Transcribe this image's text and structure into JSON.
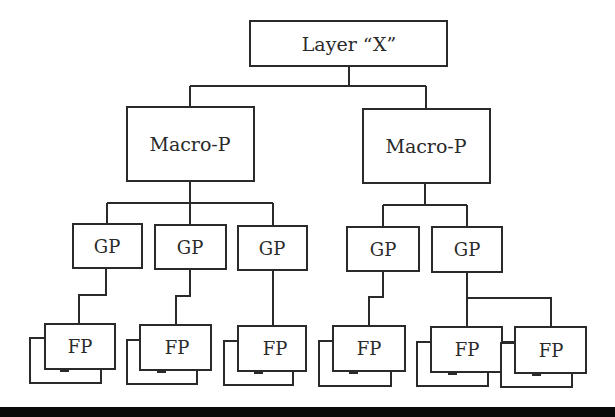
{
  "diagram": {
    "root": {
      "label": "Layer “X”"
    },
    "macros": [
      {
        "label": "Macro-P"
      },
      {
        "label": "Macro-P"
      }
    ],
    "gps": [
      {
        "label": "GP",
        "parent": 0
      },
      {
        "label": "GP",
        "parent": 0
      },
      {
        "label": "GP",
        "parent": 0
      },
      {
        "label": "GP",
        "parent": 1
      },
      {
        "label": "GP",
        "parent": 1
      }
    ],
    "fps": [
      {
        "label": "FP",
        "parent": 0
      },
      {
        "label": "FP",
        "parent": 1
      },
      {
        "label": "FP",
        "parent": 2
      },
      {
        "label": "FP",
        "parent": 3
      },
      {
        "label": "FP",
        "parent": 4
      },
      {
        "label": "FP",
        "parent": 4
      }
    ],
    "colors": {
      "stroke": "#2a2a2a",
      "background": "#ffffff",
      "bottom_bar": "#0a0a0a"
    }
  }
}
